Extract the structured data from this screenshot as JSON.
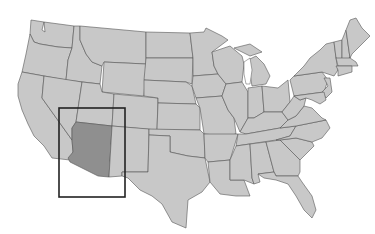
{
  "map": {
    "title": "",
    "region": "Contiguous United States",
    "highlighted_state": "Arizona",
    "colors": {
      "land": "#c8c8c8",
      "border": "#555555",
      "highlight": "#8f8f8f",
      "focus_box": "#222222",
      "background": "#ffffff"
    },
    "focus_box": {
      "x": 59,
      "y": 108,
      "width": 66,
      "height": 89
    }
  }
}
